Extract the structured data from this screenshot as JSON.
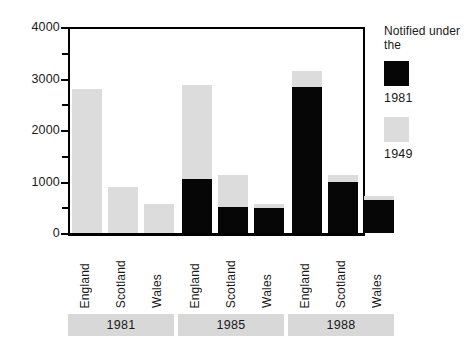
{
  "chart_data": {
    "type": "bar",
    "title": "",
    "xlabel": "",
    "ylabel": "",
    "ylim": [
      0,
      4000
    ],
    "ytick_labels": [
      "0",
      "1000",
      "2000",
      "3000",
      "4000"
    ],
    "ytick_values": [
      0,
      1000,
      2000,
      3000,
      4000
    ],
    "minor_tick_values": [
      500,
      1500,
      2500,
      3500
    ],
    "grid": false,
    "stacked": true,
    "legend_position": "right",
    "legend_title": "Notified under\nthe",
    "categories": [
      "England",
      "Scotland",
      "Wales",
      "England",
      "Scotland",
      "Wales",
      "England",
      "Scotland",
      "Wales"
    ],
    "groups": [
      {
        "label": "1981",
        "categories": [
          "England",
          "Scotland",
          "Wales"
        ]
      },
      {
        "label": "1985",
        "categories": [
          "England",
          "Scotland",
          "Wales"
        ]
      },
      {
        "label": "1988",
        "categories": [
          "England",
          "Scotland",
          "Wales"
        ]
      }
    ],
    "series": [
      {
        "name": "1981",
        "color": "#060606",
        "values": [
          0,
          0,
          0,
          1040,
          500,
          480,
          2840,
          1000,
          635
        ]
      },
      {
        "name": "1949",
        "color": "#dcdcdc",
        "values": [
          2800,
          900,
          560,
          1830,
          620,
          80,
          310,
          130,
          75
        ]
      }
    ],
    "totals": [
      2800,
      900,
      560,
      2870,
      1120,
      560,
      3150,
      1130,
      710
    ],
    "bars": [
      {
        "group": "1981",
        "category": "England",
        "notified_1981": 0,
        "notified_1949": 2800,
        "total": 2800
      },
      {
        "group": "1981",
        "category": "Scotland",
        "notified_1981": 0,
        "notified_1949": 900,
        "total": 900
      },
      {
        "group": "1981",
        "category": "Wales",
        "notified_1981": 0,
        "notified_1949": 560,
        "total": 560
      },
      {
        "group": "1985",
        "category": "England",
        "notified_1981": 1040,
        "notified_1949": 1830,
        "total": 2870
      },
      {
        "group": "1985",
        "category": "Scotland",
        "notified_1981": 500,
        "notified_1949": 620,
        "total": 1120
      },
      {
        "group": "1985",
        "category": "Wales",
        "notified_1981": 480,
        "notified_1949": 80,
        "total": 560
      },
      {
        "group": "1988",
        "category": "England",
        "notified_1981": 2840,
        "notified_1949": 310,
        "total": 3150
      },
      {
        "group": "1988",
        "category": "Scotland",
        "notified_1981": 1000,
        "notified_1949": 130,
        "total": 1130
      },
      {
        "group": "1988",
        "category": "Wales",
        "notified_1981": 635,
        "notified_1949": 75,
        "total": 710
      }
    ]
  },
  "legend": {
    "title": "Notified under\nthe",
    "entries": [
      {
        "label": "1981",
        "color": "#060606"
      },
      {
        "label": "1949",
        "color": "#dcdcdc"
      }
    ]
  },
  "axis": {
    "y_labels": [
      "4000",
      "3000",
      "2000",
      "1000",
      "0"
    ]
  },
  "colors": {
    "series_1981": "#060606",
    "series_1949": "#dcdcdc",
    "band": "#d8d8d8",
    "axis": "#000000",
    "background": "#ffffff"
  }
}
